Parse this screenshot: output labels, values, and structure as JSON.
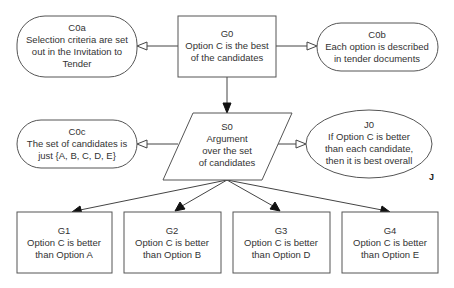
{
  "diagram": {
    "type": "GSN goal structure",
    "nodes": {
      "C0a": {
        "id": "C0a",
        "kind": "context",
        "lines": [
          "Selection criteria are set",
          "out in the Invitation to",
          "Tender"
        ]
      },
      "G0": {
        "id": "G0",
        "kind": "goal",
        "lines": [
          "Option C is the best",
          "of the candidates"
        ]
      },
      "C0b": {
        "id": "C0b",
        "kind": "context",
        "lines": [
          "Each option is described",
          "in tender documents"
        ]
      },
      "C0c": {
        "id": "C0c",
        "kind": "context",
        "lines": [
          "The set of candidates is",
          "just {A, B, C, D, E}"
        ]
      },
      "S0": {
        "id": "S0",
        "kind": "strategy",
        "lines": [
          "Argument",
          "over the set",
          "of candidates"
        ]
      },
      "J0": {
        "id": "J0",
        "kind": "justification",
        "lines": [
          "If Option C is better",
          "than each candidate,",
          "then it is best overall"
        ],
        "marker": "J"
      },
      "G1": {
        "id": "G1",
        "kind": "goal",
        "lines": [
          "Option C is better",
          "than Option A"
        ]
      },
      "G2": {
        "id": "G2",
        "kind": "goal",
        "lines": [
          "Option C is better",
          "than Option B"
        ]
      },
      "G3": {
        "id": "G3",
        "kind": "goal",
        "lines": [
          "Option C is better",
          "than Option D"
        ]
      },
      "G4": {
        "id": "G4",
        "kind": "goal",
        "lines": [
          "Option C is better",
          "than Option E"
        ]
      }
    },
    "edges": [
      {
        "from": "G0",
        "to": "C0a",
        "type": "in-context-of"
      },
      {
        "from": "G0",
        "to": "C0b",
        "type": "in-context-of"
      },
      {
        "from": "G0",
        "to": "S0",
        "type": "supported-by"
      },
      {
        "from": "S0",
        "to": "C0c",
        "type": "in-context-of"
      },
      {
        "from": "S0",
        "to": "J0",
        "type": "in-context-of"
      },
      {
        "from": "S0",
        "to": "G1",
        "type": "supported-by"
      },
      {
        "from": "S0",
        "to": "G2",
        "type": "supported-by"
      },
      {
        "from": "S0",
        "to": "G3",
        "type": "supported-by"
      },
      {
        "from": "S0",
        "to": "G4",
        "type": "supported-by"
      }
    ],
    "colors": {
      "stroke": "#555555",
      "text": "#333333",
      "background": "#ffffff"
    }
  }
}
